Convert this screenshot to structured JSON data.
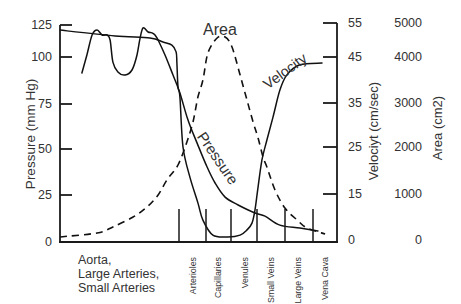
{
  "chart_data": {
    "type": "line",
    "title": "",
    "xlabel": "",
    "grid": false,
    "legend": "none (curves labeled inline)",
    "categories": [
      "Aorta, Large Arteries, Small Arteries",
      "Arterioles",
      "Capillaries",
      "Venules",
      "Small Veins",
      "Large Veins",
      "Vena Cava"
    ],
    "category_labels": {
      "aorta_lines": [
        "Aorta,",
        "Large Arteries,",
        "Small Arteries"
      ],
      "rotated": [
        "Arterioles",
        "Capillaries",
        "Venules",
        "Small Veins",
        "Large Veins",
        "Vena Cava"
      ]
    },
    "category_dividers_pct": [
      43.0,
      52.7,
      61.7,
      71.1,
      81.2,
      91.3
    ],
    "axes": {
      "left": {
        "label": "Pressure (mm Hg)",
        "tick_values": [
          0,
          25,
          50,
          75,
          100,
          125
        ],
        "range": [
          0,
          125
        ]
      },
      "right_velocity": {
        "label": "Velociyt (cm/sec)",
        "tick_values": [
          0,
          15,
          25,
          35,
          45,
          55
        ],
        "range": [
          0,
          55
        ]
      },
      "right_area": {
        "label": "Area (cm2)",
        "tick_values": [
          0,
          1000,
          2000,
          3000,
          4000,
          5000
        ],
        "range": [
          0,
          5000
        ]
      }
    },
    "curve_labels": {
      "area": "Area",
      "velocity": "Velocity",
      "pressure": "Pressure"
    },
    "x_units": "percent of horizontal axis (0 = left axis, 100 = right axis)",
    "series": [
      {
        "name": "Pressure",
        "axis": "left",
        "style": "solid",
        "points": [
          [
            7.9,
            91.5
          ],
          [
            9.7,
            101.6
          ],
          [
            11.6,
            117.2
          ],
          [
            13.4,
            121.1
          ],
          [
            15.2,
            117.2
          ],
          [
            17.0,
            117.2
          ],
          [
            18.1,
            113.3
          ],
          [
            19.1,
            97.3
          ],
          [
            20.9,
            92.0
          ],
          [
            23.5,
            90.4
          ],
          [
            26.0,
            93.1
          ],
          [
            27.8,
            101.6
          ],
          [
            28.9,
            114.8
          ],
          [
            30.0,
            122.7
          ],
          [
            31.8,
            119.5
          ],
          [
            33.2,
            118.8
          ],
          [
            34.3,
            117.2
          ],
          [
            35.4,
            113.3
          ],
          [
            37.9,
            101.6
          ],
          [
            40.8,
            90.4
          ],
          [
            43.3,
            80.9
          ],
          [
            46.2,
            66.1
          ],
          [
            49.5,
            53.3
          ],
          [
            53.1,
            40.2
          ],
          [
            56.0,
            31.5
          ],
          [
            59.6,
            23.9
          ],
          [
            64.3,
            19.7
          ],
          [
            70.4,
            15.4
          ],
          [
            74.0,
            13.8
          ],
          [
            79.4,
            9.0
          ],
          [
            86.6,
            7.4
          ],
          [
            93.1,
            5.9
          ]
        ]
      },
      {
        "name": "Velocity",
        "axis": "right_velocity",
        "style": "solid",
        "points": [
          [
            0,
            52.9
          ],
          [
            19.9,
            51.2
          ],
          [
            32.5,
            50.6
          ],
          [
            37.2,
            49.4
          ],
          [
            40.4,
            48.5
          ],
          [
            41.9,
            46.5
          ],
          [
            42.2,
            43.7
          ],
          [
            42.6,
            38.5
          ],
          [
            43.3,
            36.3
          ],
          [
            44.4,
            25.0
          ],
          [
            46.9,
            18.6
          ],
          [
            49.8,
            12.1
          ],
          [
            51.6,
            6.5
          ],
          [
            55.2,
            1.6
          ],
          [
            60.6,
            1.0
          ],
          [
            65.0,
            1.6
          ],
          [
            67.5,
            3.3
          ],
          [
            69.3,
            5.5
          ],
          [
            70.4,
            9.8
          ],
          [
            71.5,
            16.5
          ],
          [
            72.9,
            22.2
          ],
          [
            74.7,
            26.6
          ],
          [
            76.9,
            31.8
          ],
          [
            79.4,
            37.8
          ],
          [
            81.9,
            41.1
          ],
          [
            86.6,
            43.3
          ],
          [
            94.6,
            43.7
          ]
        ]
      },
      {
        "name": "Area",
        "axis": "right_area",
        "style": "dashed",
        "points": [
          [
            0,
            65
          ],
          [
            13.4,
            153
          ],
          [
            19.1,
            283
          ],
          [
            26.4,
            500
          ],
          [
            31.4,
            717
          ],
          [
            35.4,
            978
          ],
          [
            38.6,
            1298
          ],
          [
            42.6,
            1617
          ],
          [
            45.8,
            2114
          ],
          [
            48.0,
            2568
          ],
          [
            49.8,
            3130
          ],
          [
            51.6,
            3500
          ],
          [
            53.4,
            4118
          ],
          [
            56.7,
            4559
          ],
          [
            59.6,
            4588
          ],
          [
            62.1,
            4294
          ],
          [
            65.0,
            3609
          ],
          [
            67.5,
            3065
          ],
          [
            69.7,
            2568
          ],
          [
            71.5,
            2205
          ],
          [
            73.3,
            1787
          ],
          [
            74.7,
            1574
          ],
          [
            77.6,
            1085
          ],
          [
            81.2,
            696
          ],
          [
            85.6,
            435
          ],
          [
            89.2,
            261
          ],
          [
            95.7,
            130
          ]
        ]
      }
    ]
  }
}
